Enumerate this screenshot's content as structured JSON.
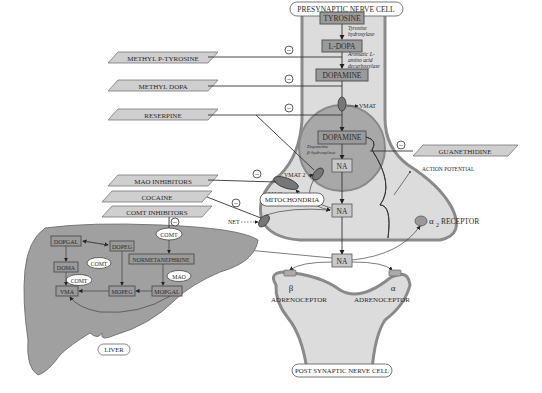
{
  "presynaptic": {
    "title": "PRESYNAPTIC NERVE CELL",
    "pathway": [
      "TYROSINE",
      "L-DOPA",
      "DOPAMINE"
    ],
    "enzymes": [
      "Tyrosine hydroxylase",
      "Aromatic L-amino acid decarboxylase",
      "Dopamine β-hydroxylase"
    ],
    "enzyme_lines": {
      "tyrosine_hydroxylase": [
        "Tyrosine",
        "hydroxylase"
      ],
      "aadc": [
        "Aromatic L-",
        "amino acid",
        "decarboxylase"
      ],
      "dbh": [
        "Dopamine",
        "β-hydroxylase"
      ]
    },
    "vesicle_dopamine": "DOPAMINE",
    "vesicle_na": "NA",
    "cytosol_na": "NA",
    "vmat": "VMAT",
    "vmat2": "VMAT 2",
    "mao": "MAO",
    "mitochondria": "MITOCHONDRIA",
    "net": "NET",
    "action_potential": "ACTION POTENTIAL",
    "alpha2_receptor_symbol": "α",
    "alpha2_receptor_sub": "2",
    "alpha2_receptor_label": "RECEPTOR"
  },
  "synapse": {
    "na": "NA"
  },
  "postsynaptic": {
    "title": "POST SYNAPTIC NERVE CELL",
    "beta_symbol": "β",
    "alpha_symbol": "α",
    "beta_label": "ADRENOCEPTOR",
    "alpha_label": "ADRENOCEPTOR"
  },
  "drugs": [
    "METHYL P-TYROSINE",
    "METHYL DOPA",
    "RESERPINE",
    "MAO INHIBITORS",
    "COCAINE",
    "COMT INHIBITORS",
    "GUANETHIDINE"
  ],
  "inhibition_symbol": "−",
  "liver": {
    "title": "LIVER",
    "boxes": [
      "DOPGAL",
      "DOPEG",
      "NORMETANEPHRINE",
      "DOMA",
      "VMA",
      "MOPEG",
      "MOPGAL"
    ],
    "enzymes": [
      "COMT",
      "COMT",
      "COMT",
      "MAO"
    ]
  },
  "colors": {
    "box_fill": "#9a9a9a",
    "para_fill": "#cfcfcf",
    "cell_fill": "#dcdcdc",
    "cell_border": "#8a8a8a",
    "vesicle_fill": "#a8a8a8",
    "liver_fill": "#a0a0a0"
  }
}
